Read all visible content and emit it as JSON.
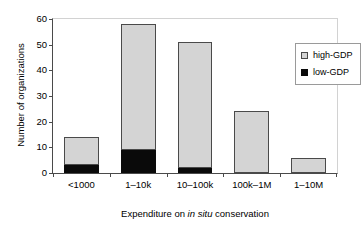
{
  "chart_data": {
    "type": "bar",
    "subtype": "stacked-bar",
    "title": "",
    "xlabel": "Expenditure on in situ conservation",
    "xlabel_parts": [
      {
        "text": "Expenditure on ",
        "italic": false
      },
      {
        "text": "in situ",
        "italic": true
      },
      {
        "text": " conservation",
        "italic": false
      }
    ],
    "ylabel": "Number of organizations",
    "categories": [
      "<1000",
      "1–10k",
      "10–100k",
      "100k–1M",
      "1–10M"
    ],
    "series": [
      {
        "name": "low-GDP",
        "color": "#0a0a0a",
        "values": [
          3,
          9,
          2,
          0,
          0
        ]
      },
      {
        "name": "high-GDP",
        "color": "#d4d4d4",
        "values": [
          11,
          49,
          49,
          24,
          6
        ]
      }
    ],
    "totals": [
      14,
      58,
      51,
      24,
      6
    ],
    "ylim": [
      0,
      60
    ],
    "yticks": [
      0,
      10,
      20,
      30,
      40,
      50,
      60
    ],
    "ytick_labels": [
      "0",
      "10",
      "20",
      "30",
      "40",
      "50",
      "60"
    ],
    "grid": false,
    "legend_position": "top-right",
    "legend_entries": [
      {
        "label": "high-GDP",
        "swatch": "high"
      },
      {
        "label": "low-GDP",
        "swatch": "low"
      }
    ]
  }
}
